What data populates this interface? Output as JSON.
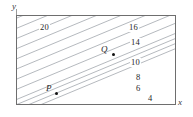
{
  "figure": {
    "type": "contour-plot",
    "axes": {
      "x_label": "x",
      "y_label": "y"
    },
    "frame": {
      "x": 16,
      "y": 15,
      "width": 160,
      "height": 90
    }
  },
  "chart_data": {
    "type": "line",
    "title": "",
    "subtitle": "",
    "xlabel": "x",
    "ylabel": "y",
    "grid": false,
    "legend": "none",
    "contour_labels": [
      "20",
      "16",
      "14",
      "10",
      "8",
      "6",
      "4"
    ],
    "contour_values": [
      20,
      16,
      14,
      10,
      8,
      6,
      4
    ],
    "contours": [
      {
        "label": "20",
        "value": 20,
        "label_x": 38,
        "label_y": 22,
        "show_label": true
      },
      {
        "label": "",
        "value": 18,
        "label_x": 0,
        "label_y": 0,
        "show_label": false
      },
      {
        "label": "16",
        "value": 16,
        "label_x": 127,
        "label_y": 22,
        "show_label": true
      },
      {
        "label": "14",
        "value": 14,
        "label_x": 129,
        "label_y": 37,
        "show_label": true
      },
      {
        "label": "",
        "value": 12,
        "label_x": 0,
        "label_y": 0,
        "show_label": false
      },
      {
        "label": "10",
        "value": 10,
        "label_x": 129,
        "label_y": 57,
        "show_label": true
      },
      {
        "label": "8",
        "value": 8,
        "label_x": 134,
        "label_y": 72,
        "show_label": true
      },
      {
        "label": "6",
        "value": 6,
        "label_x": 134,
        "label_y": 83,
        "show_label": true
      },
      {
        "label": "4",
        "value": 4,
        "label_x": 146,
        "label_y": 93,
        "show_label": true
      }
    ],
    "points": [
      {
        "name": "P",
        "label": "P",
        "dot_x": 54,
        "dot_y": 91,
        "label_x": 45,
        "label_y": 83
      },
      {
        "name": "Q",
        "label": "Q",
        "dot_x": 111,
        "dot_y": 52,
        "label_x": 100,
        "label_y": 44
      }
    ],
    "colors": {
      "contour_line": "#9aa0a6",
      "frame": "#6e6e6e",
      "text": "#1f1f1f",
      "point": "#111111",
      "background": "#ffffff"
    }
  }
}
